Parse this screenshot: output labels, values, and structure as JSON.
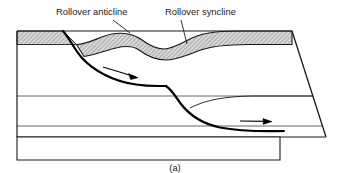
{
  "figure": {
    "caption": "(a)",
    "type": "geological-cross-section"
  },
  "annotations": [
    {
      "id": "rollover-anticline",
      "label": "Rollover anticline",
      "text_x": 55,
      "text_y": 15,
      "leader": {
        "x1": 112,
        "y1": 20,
        "x2": 128,
        "y2": 33
      }
    },
    {
      "id": "rollover-syncline",
      "label": "Rollover syncline",
      "text_x": 165,
      "text_y": 15,
      "leader": {
        "x1": 180,
        "y1": 20,
        "x2": 186,
        "y2": 45
      }
    }
  ],
  "geometry": {
    "marker_layer_fill": "#d4d4d4",
    "hatch_stroke": "#6e6e6e",
    "line_color": "#000000",
    "thin_line_color": "#4d4d4d",
    "fault_color": "#000000",
    "background": "#ffffff",
    "footwall_block": "M17,31 L63,31 L76,44 L17,44 Z",
    "marker_folded_path": "M76,44 C92,44 104,34 124,33 C144,32 152,45 168,47 C180,48 188,40 206,35 C226,30 250,31 292,31 L292,44 C252,44 232,45 212,49 C196,52 184,60 170,59 C154,58 146,47 128,47 C110,47 96,55 82,56 Z",
    "outer_boundary": "M17,31 L292,31 L326,137 L17,137 Z",
    "right_edge": "M292,31 L326,137",
    "strata_line_upper": "M17,96 L313,96",
    "strata_line_lower": "M17,126 L322,126",
    "strata_line_mid_right": "M196,104 C222,96 250,96 313,96",
    "fault_main": "M63,31 C72,40 78,52 92,64 C108,78 128,86 155,86 L163,86 C170,86 172,90 176,96 C184,108 198,122 222,127 C248,132 268,131 284,131",
    "basement_box": "M17,137 L280,137 L280,160 L17,160 Z",
    "lower_detachment": "M222,127 L284,131"
  },
  "slip_arrows": [
    {
      "id": "upper-slip-arrow",
      "path": "M103,68 L137,77",
      "head": "M137,77 L129,74 L131,79 Z",
      "direction": "down-right"
    },
    {
      "id": "lower-slip-arrow",
      "path": "M242,122 L270,122",
      "head": "M270,122 L263,119 L263,125 Z",
      "direction": "right"
    }
  ]
}
